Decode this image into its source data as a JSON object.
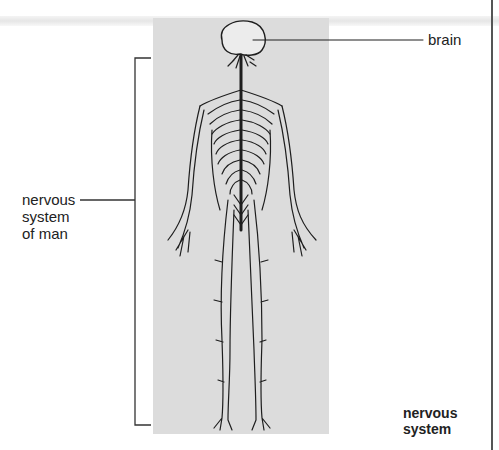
{
  "diagram": {
    "title": "nervous system",
    "labels": {
      "brain": "brain",
      "nervous_system_of_man": [
        "nervous",
        "system",
        "of man"
      ],
      "caption": [
        "nervous",
        "system"
      ]
    },
    "colors": {
      "panel": "#dcdcdc",
      "line": "#222222",
      "brain_fill": "#ececec"
    }
  }
}
